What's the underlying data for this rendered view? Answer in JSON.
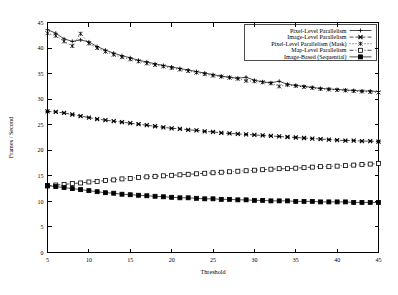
{
  "chart_data": {
    "type": "line",
    "title": "",
    "xlabel": "Threshold",
    "ylabel": "Frames / Second",
    "xlim": [
      5,
      45
    ],
    "ylim": [
      0,
      45
    ],
    "xticks": [
      5,
      10,
      15,
      20,
      25,
      30,
      35,
      40,
      45
    ],
    "yticks": [
      0,
      5,
      10,
      15,
      20,
      25,
      30,
      35,
      40,
      45
    ],
    "grid": false,
    "legend_position": "top-right",
    "x": [
      5,
      6,
      7,
      8,
      9,
      10,
      11,
      12,
      13,
      14,
      15,
      16,
      17,
      18,
      19,
      20,
      21,
      22,
      23,
      24,
      25,
      26,
      27,
      28,
      29,
      30,
      31,
      32,
      33,
      34,
      35,
      36,
      37,
      38,
      39,
      40,
      41,
      42,
      43,
      44,
      45
    ],
    "series": [
      {
        "name": "Pixel-Level Parallelism",
        "marker": "plus",
        "linestyle": "solid",
        "values": [
          43.6,
          42.9,
          41.8,
          41.3,
          41.6,
          41.2,
          40.3,
          39.6,
          39.0,
          38.5,
          38.1,
          37.6,
          37.3,
          36.9,
          36.6,
          36.3,
          36.0,
          35.7,
          35.4,
          35.1,
          34.8,
          34.5,
          34.3,
          34.1,
          34.3,
          33.7,
          33.4,
          33.2,
          33.5,
          32.9,
          32.7,
          32.5,
          32.3,
          32.1,
          32.0,
          31.9,
          31.8,
          31.7,
          31.6,
          31.6,
          31.5
        ]
      },
      {
        "name": "Image-Level Parallelism",
        "marker": "asterisk",
        "linestyle": "dashed",
        "values": [
          27.6,
          27.5,
          27.3,
          27.0,
          26.7,
          26.4,
          26.1,
          25.9,
          25.7,
          25.5,
          25.3,
          25.1,
          24.9,
          24.7,
          24.5,
          24.3,
          24.2,
          24.0,
          23.9,
          23.7,
          23.6,
          23.4,
          23.3,
          23.2,
          23.1,
          23.0,
          22.9,
          22.8,
          22.7,
          22.6,
          22.5,
          22.4,
          22.3,
          22.2,
          22.1,
          22.0,
          21.9,
          21.9,
          21.8,
          21.8,
          21.7
        ]
      },
      {
        "name": "Pixel-Level Parallelism (Mask)",
        "marker": "asterisk-open",
        "linestyle": "dotted",
        "values": [
          42.9,
          42.4,
          41.3,
          40.4,
          42.8,
          40.9,
          40.0,
          39.3,
          38.7,
          38.2,
          37.8,
          37.4,
          37.0,
          36.7,
          36.4,
          36.1,
          35.8,
          35.5,
          35.2,
          34.9,
          34.6,
          34.4,
          34.2,
          34.0,
          33.6,
          33.5,
          33.3,
          33.1,
          32.5,
          32.8,
          32.6,
          32.4,
          32.2,
          32.0,
          31.9,
          31.8,
          31.7,
          31.6,
          31.5,
          31.4,
          31.3
        ]
      },
      {
        "name": "Map-Level Parallelism",
        "marker": "square-open",
        "linestyle": "dashdot",
        "values": [
          13.0,
          13.2,
          13.3,
          13.5,
          13.6,
          13.8,
          13.9,
          14.1,
          14.2,
          14.4,
          14.5,
          14.7,
          14.8,
          14.9,
          15.0,
          15.1,
          15.2,
          15.3,
          15.4,
          15.5,
          15.6,
          15.7,
          15.8,
          15.9,
          16.0,
          16.1,
          16.2,
          16.3,
          16.4,
          16.4,
          16.5,
          16.6,
          16.7,
          16.8,
          16.8,
          16.9,
          17.0,
          17.1,
          17.2,
          17.3,
          17.4
        ]
      },
      {
        "name": "Image-Based (Sequential)",
        "marker": "square-filled",
        "linestyle": "solid",
        "values": [
          13.1,
          12.9,
          12.7,
          12.5,
          12.3,
          12.1,
          11.9,
          11.7,
          11.6,
          11.4,
          11.3,
          11.2,
          11.1,
          11.0,
          10.9,
          10.8,
          10.7,
          10.7,
          10.6,
          10.5,
          10.5,
          10.4,
          10.4,
          10.3,
          10.3,
          10.2,
          10.2,
          10.1,
          10.1,
          10.1,
          10.0,
          10.0,
          10.0,
          9.9,
          9.9,
          9.9,
          9.9,
          9.8,
          9.8,
          9.8,
          9.8
        ]
      }
    ]
  }
}
